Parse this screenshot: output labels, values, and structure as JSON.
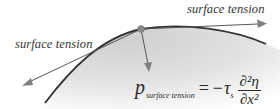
{
  "diagram": {
    "labels": {
      "top_right": "surface tension",
      "left": "surface tension"
    },
    "formula": {
      "lhs_symbol": "p",
      "lhs_subscript": "surface tension",
      "equals": "=",
      "minus": "−",
      "tau": "τ",
      "tau_subscript": "s",
      "numerator": "∂²η",
      "denominator": "∂x²",
      "full_text": "p_surface tension = −τ_s ∂²η/∂x²"
    },
    "colors": {
      "curve": "#333333",
      "arrow": "#555555",
      "arrowhead": "#808080",
      "point": "#8a8a8a",
      "fill": "#d9d9d9"
    }
  }
}
